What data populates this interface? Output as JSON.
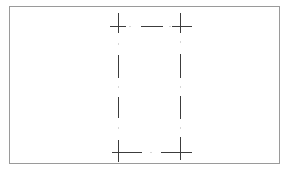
{
  "diagram": {
    "type": "dash-dot rectangle outline with corner crosshairs",
    "frame": {
      "x": 9,
      "y": 6,
      "width": 271,
      "height": 158,
      "color": "#9a9a9a"
    },
    "rectangle": {
      "left": 118,
      "top": 26,
      "right": 180,
      "bottom": 152
    },
    "stroke_color": "#3c3c3c",
    "dot_color": "#b0b0b0",
    "corner_crosshairs": [
      {
        "x": 118,
        "y": 26,
        "h": [
          110,
          126
        ],
        "v": [
          13,
          33
        ]
      },
      {
        "x": 180,
        "y": 26,
        "h": [
          172,
          192
        ],
        "v": [
          13,
          33
        ]
      },
      {
        "x": 118,
        "y": 152,
        "h": [
          112,
          142
        ],
        "v": [
          140,
          162
        ]
      },
      {
        "x": 180,
        "y": 152,
        "h": [
          161,
          192
        ],
        "v": [
          137,
          160
        ]
      }
    ],
    "top_edge_dashes": [
      [
        141,
        163
      ]
    ],
    "left_edge_dashes": [
      [
        55,
        78
      ],
      [
        97,
        118
      ]
    ],
    "right_edge_dashes": [
      [
        54,
        78
      ],
      [
        96,
        119
      ]
    ],
    "top_edge_dots": [
      130,
      170
    ],
    "bottom_edge_dots": [
      151
    ],
    "left_edge_dots": [
      44,
      87,
      128
    ],
    "right_edge_dots": [
      42,
      87,
      128
    ]
  }
}
